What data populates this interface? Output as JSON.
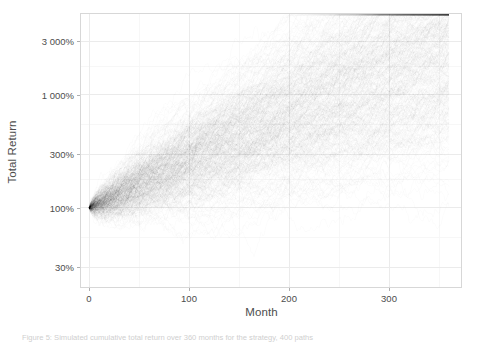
{
  "figure": {
    "width": 481,
    "height": 341,
    "background": "#ffffff"
  },
  "panel": {
    "left": 80,
    "top": 13,
    "width": 382,
    "height": 275,
    "background": "#ffffff",
    "border_color": "#d7d7d7",
    "major_grid_color": "#ebebeb",
    "minor_grid_color": "#f5f5f5"
  },
  "axes": {
    "x": {
      "title": "Month",
      "tick_labels": [
        "0",
        "100",
        "200",
        "300"
      ],
      "tick_values": [
        0,
        100,
        200,
        300
      ],
      "minor_tick_values": [
        50,
        150,
        250,
        350
      ],
      "range": [
        -8,
        372
      ]
    },
    "y": {
      "title": "Total Return",
      "tick_labels": [
        "30%",
        "100%",
        "300%",
        "1 000%",
        "3 000%"
      ],
      "tick_values": [
        30,
        100,
        300,
        1000,
        3000
      ],
      "minor_tick_values": [
        55,
        180,
        550,
        1800,
        5500
      ],
      "scale": "log10",
      "range": [
        20,
        5200
      ]
    }
  },
  "chart_data": {
    "type": "line",
    "title": "",
    "subtitle": "",
    "xlabel": "Month",
    "ylabel": "Total Return",
    "xlim": [
      -8,
      372
    ],
    "ylim": [
      20,
      5200
    ],
    "yscale": "log10",
    "grid": true,
    "legend": "none",
    "series_description": "Monte Carlo simulation: many overlapping cumulative total-return paths (spaghetti plot) starting at 100% in month 0 and fanning out over 360 months.",
    "n_series": 400,
    "n_points_per_series": 361,
    "line_color": "#000000",
    "line_opacity": 0.05,
    "line_width": 0.35,
    "model": {
      "type": "geometric-brownian-motion",
      "start_value_pct": 100,
      "monthly_drift_log": 0.0089,
      "monthly_volatility_log": 0.042,
      "seed": 20240517
    },
    "envelope": {
      "x": [
        0,
        30,
        60,
        90,
        120,
        150,
        180,
        210,
        240,
        270,
        300,
        330,
        360
      ],
      "median": [
        100,
        128,
        165,
        215,
        280,
        365,
        470,
        600,
        760,
        960,
        1180,
        1420,
        1650
      ],
      "upper": [
        100,
        215,
        330,
        470,
        640,
        850,
        1080,
        1380,
        1720,
        2080,
        2450,
        2800,
        3100
      ],
      "lower": [
        100,
        58,
        52,
        55,
        62,
        74,
        92,
        118,
        150,
        195,
        250,
        320,
        410
      ]
    },
    "x": [
      0,
      60,
      120,
      180,
      240,
      300,
      360
    ],
    "values": [
      100,
      165,
      280,
      470,
      760,
      1180,
      1650
    ]
  },
  "caption": {
    "text": "Figure 5: Simulated cumulative total return over 360 months for the strategy, 400 paths"
  }
}
